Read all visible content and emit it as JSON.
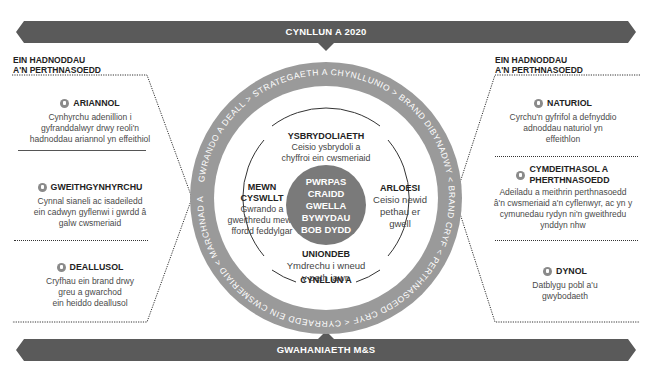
{
  "top_banner": {
    "label": "CYNLLUN A 2020"
  },
  "bottom_banner": {
    "label": "GWAHANIAETH M&S"
  },
  "left_panel": {
    "heading_line1": "EIN HADNODDAU",
    "heading_line2": "A'N PERTHNASOEDD",
    "items": [
      {
        "icon": "pound-coin-icon",
        "title": "ARIANNOL",
        "lines": [
          "Cynhyrchu adenillion i",
          "gyfranddalwyr drwy reoli'n",
          "hadnoddau ariannol yn effeithiol"
        ]
      },
      {
        "icon": "cycle-arrow-icon",
        "title": "GWEITHGYNHYRCHU",
        "lines": [
          "Cynnal sianeli ac isadeiledd",
          "ein cadwyn gyflenwi i gwrdd â",
          "galw cwsmeriaid"
        ]
      },
      {
        "icon": "brain-icon",
        "title": "DEALLUSOL",
        "lines": [
          "Cryfhau ein brand drwy",
          "greu a gwarchod",
          "ein heiddo deallusol"
        ]
      }
    ]
  },
  "right_panel": {
    "heading_line1": "EIN HADNODDAU",
    "heading_line2": "A'N PERTHNASOEDD",
    "items": [
      {
        "icon": "leaf-icon",
        "title": "NATURIOL",
        "lines": [
          "Cyrchu'n gyfrifol a defnyddio",
          "adnoddau naturiol yn",
          "effeithlon"
        ]
      },
      {
        "icon": "people-icon",
        "title_line1": "CYMDEITHASOL A",
        "title_line2": "PHERTHNASOEDD",
        "lines": [
          "Adeiladu a meithrin perthnasoedd",
          "â'n cwsmeriaid a'n cyflenwyr, ac yn y",
          "cymunedau rydyn ni'n gweithredu",
          "ynddyn nhw"
        ]
      },
      {
        "icon": "person-icon",
        "title": "DYNOL",
        "lines": [
          "Datblygu pobl a'u",
          "gwybodaeth"
        ]
      }
    ]
  },
  "ring": {
    "text": "GWRANDO A DEALL  >  STRATEGAETH A CHYNLLUNIO  >  BRAND DIBYNADWY  <  BRAND CRYF  <  PERTHNASOEDD CRYF  <  CYRRAEDD EIN CWSMERIAID  <  MARCHNAD A GWASANAETHU  >",
    "segments": [
      "GWRANDO A DEALL",
      "STRATEGAETH A CHYNLLUNIO",
      "BRAND DIBYNADWY",
      "PERTHNASOEDD CRYF",
      "CYRRAEDD EIN CWSMERIAID",
      "MARCHNAD A GWASANAETHU"
    ],
    "color": "#9a9a9a"
  },
  "values": {
    "top": {
      "title": "YSBRYDOLIAETH",
      "lines": [
        "Ceisio ysbrydoli a",
        "chyffroi ein cwsmeriaid"
      ]
    },
    "left": {
      "title": "MEWN CYSWLLT",
      "lines": [
        "Gwrando a",
        "gweithredu mewn",
        "ffordd feddylgar"
      ]
    },
    "right": {
      "title": "ARLOESI",
      "lines": [
        "Ceisio newid",
        "pethau er",
        "gwell"
      ]
    },
    "bottom": {
      "title": "UNIONDEB",
      "lines": [
        "Ymdrechu i wneud",
        "y peth iawn"
      ]
    },
    "plan_label": "CYNLLUN A"
  },
  "core": {
    "lines": [
      "PWRPAS",
      "CRAIDD",
      "GWELLA",
      "BYWYDAU",
      "BOB DYDD"
    ],
    "color": "#7a7a7a"
  },
  "colors": {
    "banner": "#5a5a5a",
    "ring": "#9a9a9a",
    "core": "#7a7a7a",
    "text": "#3a3a3a"
  }
}
